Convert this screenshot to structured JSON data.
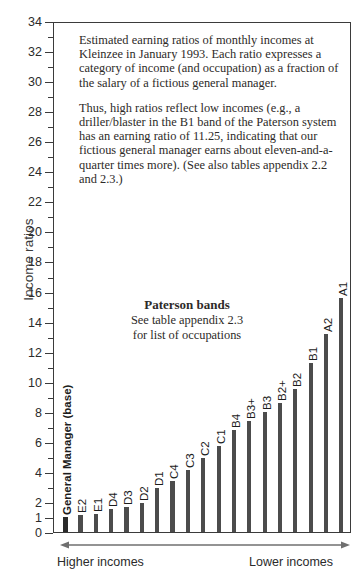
{
  "chart_data": {
    "type": "bar",
    "title": "",
    "xlabel": "",
    "ylabel": "Income ratios",
    "ylim": [
      0,
      34
    ],
    "grid": false,
    "legend": "none",
    "categories": [
      "General Manager (base)",
      "E2",
      "E1",
      "D4",
      "D3",
      "D2",
      "D1",
      "C4",
      "C3",
      "C2",
      "C1",
      "B4",
      "B3+",
      "B3",
      "B2+",
      "B2",
      "B1",
      "A2",
      "A1"
    ],
    "values": [
      1.0,
      1.1,
      1.2,
      1.5,
      1.65,
      1.95,
      2.9,
      3.4,
      4.1,
      4.9,
      5.7,
      6.8,
      7.4,
      8.0,
      8.6,
      9.5,
      11.25,
      13.2,
      15.6
    ],
    "ytick_labels": [
      "0",
      "1",
      "2",
      "4",
      "6",
      "8",
      "10",
      "12",
      "14",
      "16",
      "18",
      "20",
      "22",
      "24",
      "26",
      "28",
      "30",
      "32",
      "34"
    ],
    "ytick_values": [
      0,
      1,
      2,
      4,
      6,
      8,
      10,
      12,
      14,
      16,
      18,
      20,
      22,
      24,
      26,
      28,
      30,
      32,
      34
    ],
    "bar_color": "#4c4c4c",
    "axis_color": "#3b3b3b"
  },
  "axis": {
    "ylabel": "Income ratios",
    "left_note": "Higher incomes",
    "right_note": "Lower incomes"
  },
  "note": {
    "paragraph1": "Estimated earning ratios of monthly incomes at Kleinzee in January 1993. Each ratio expresses a category of income (and occupation) as a fraction of the salary of a fictious general manager.",
    "paragraph2": "Thus, high ratios reflect low incomes (e.g., a driller/blaster in the B1 band of the Paterson system has an earning ratio of 11.25, indicating that our fictious general manager earns about eleven-and-a-quarter times more). (See also tables appendix 2.2 and 2.3.)"
  },
  "bands": {
    "title": "Paterson bands",
    "line2": "See table appendix 2.3",
    "line3": "for list of occupations"
  }
}
